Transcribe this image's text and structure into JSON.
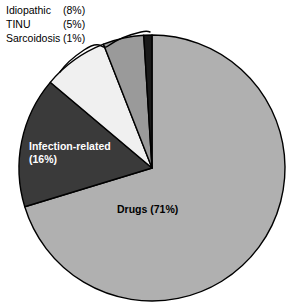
{
  "figure": {
    "width": 299,
    "height": 307,
    "background": "#ffffff"
  },
  "legend": {
    "rows": [
      {
        "label": "Idiopathic",
        "value": "(8%)"
      },
      {
        "label": "TINU",
        "value": "(5%)"
      },
      {
        "label": "Sarcoidosis",
        "value": "(1%)"
      }
    ]
  },
  "callout": {
    "name": "brace-pointer",
    "description": "hand-drawn brace linking legend to the three small slices"
  },
  "labels": {
    "infection": "Infection-related\n(16%)",
    "infection_line1": "Infection-related",
    "infection_line2": "(16%)",
    "drugs": "Drugs (71%)"
  },
  "chart_data": {
    "type": "pie",
    "title": "",
    "xlabel": "",
    "ylabel": "",
    "categories": [
      "Drugs",
      "Infection-related",
      "Idiopathic",
      "TINU",
      "Sarcoidosis"
    ],
    "values": [
      71,
      16,
      8,
      5,
      1
    ],
    "units": "percent",
    "total": 101,
    "start_angle_deg": 0,
    "direction": "clockwise",
    "legend_position": "top-left",
    "grid": false,
    "center": {
      "x": 152,
      "y": 168
    },
    "radius": 133,
    "slices": [
      {
        "name": "Drugs",
        "value": 71,
        "value_label": "Drugs (71%)",
        "color": "#b0b0b0",
        "label_placement": "inside",
        "label_color": "#000000"
      },
      {
        "name": "Infection-related",
        "value": 16,
        "value_label": "Infection-related (16%)",
        "color": "#3a3a3a",
        "label_placement": "inside",
        "label_color": "#ffffff"
      },
      {
        "name": "Idiopathic",
        "value": 8,
        "value_label": "Idiopathic (8%)",
        "color": "#f0f0f0",
        "label_placement": "legend",
        "label_color": "#000000"
      },
      {
        "name": "TINU",
        "value": 5,
        "value_label": "TINU (5%)",
        "color": "#9a9a9a",
        "label_placement": "legend",
        "label_color": "#000000"
      },
      {
        "name": "Sarcoidosis",
        "value": 1,
        "value_label": "Sarcoidosis (1%)",
        "color": "#1a1a1a",
        "label_placement": "legend",
        "label_color": "#000000"
      }
    ],
    "stroke": "#000000",
    "stroke_width": 1.4
  }
}
